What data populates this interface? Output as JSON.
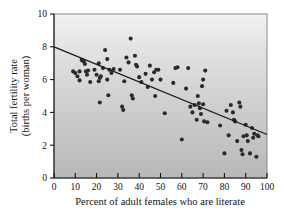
{
  "chart_data": {
    "type": "scatter",
    "title": "",
    "xlabel": "Percent of adult females who are literate",
    "ylabel": "Total fertility rate (births per woman)",
    "ylabel_line1": "Total fertility rate",
    "ylabel_line2": "(births per woman)",
    "xlim": [
      0,
      100
    ],
    "ylim": [
      0,
      10
    ],
    "xticks": [
      0,
      10,
      20,
      30,
      40,
      50,
      60,
      70,
      80,
      90,
      100
    ],
    "yticks": [
      0,
      2,
      4,
      6,
      8,
      10
    ],
    "xtick_labels": [
      "0",
      "10",
      "20",
      "30",
      "40",
      "50",
      "60",
      "70",
      "80",
      "90",
      "100"
    ],
    "ytick_labels": [
      "0",
      "2",
      "4",
      "6",
      "8",
      "10"
    ],
    "grid": false,
    "legend": "none",
    "background": "vertical gradient light-gray to medium-gray",
    "marker_color": "#2b2b2b",
    "trend_line_color": "#1a1a1a",
    "trend_line": {
      "label": "linear regression",
      "x_start": 0,
      "y_start": 8.0,
      "x_end": 100,
      "y_end": 2.65
    },
    "points": [
      [
        9,
        6.5
      ],
      [
        10,
        6.4
      ],
      [
        11,
        6.2
      ],
      [
        12,
        5.95
      ],
      [
        12,
        6.5
      ],
      [
        13,
        7.2
      ],
      [
        13.5,
        7.15
      ],
      [
        14,
        7.1
      ],
      [
        14.5,
        6.95
      ],
      [
        15,
        6.5
      ],
      [
        15.5,
        6.3
      ],
      [
        16,
        6.55
      ],
      [
        17,
        5.85
      ],
      [
        19,
        6.6
      ],
      [
        20,
        6.3
      ],
      [
        21,
        7.0
      ],
      [
        21,
        5.9
      ],
      [
        21.5,
        6.1
      ],
      [
        21.5,
        4.6
      ],
      [
        22,
        6.2
      ],
      [
        23,
        6.7
      ],
      [
        24,
        7.8
      ],
      [
        25,
        7.25
      ],
      [
        25,
        6.0
      ],
      [
        25.5,
        5.05
      ],
      [
        26,
        6.6
      ],
      [
        27,
        6.4
      ],
      [
        28,
        6.65
      ],
      [
        31,
        6.6
      ],
      [
        32,
        4.35
      ],
      [
        32.5,
        4.15
      ],
      [
        33,
        5.9
      ],
      [
        34,
        7.35
      ],
      [
        35,
        7.05
      ],
      [
        36,
        8.5
      ],
      [
        36.5,
        5.05
      ],
      [
        37,
        4.85
      ],
      [
        38,
        7.45
      ],
      [
        38.5,
        6.9
      ],
      [
        39,
        6.8
      ],
      [
        40,
        6.15
      ],
      [
        41,
        5.85
      ],
      [
        43,
        6.35
      ],
      [
        44,
        5.55
      ],
      [
        45,
        6.85
      ],
      [
        46,
        6.0
      ],
      [
        47,
        6.45
      ],
      [
        47.5,
        5.0
      ],
      [
        48,
        6.6
      ],
      [
        49,
        6.6
      ],
      [
        50,
        6.0
      ],
      [
        52,
        3.95
      ],
      [
        56,
        5.8
      ],
      [
        57,
        6.7
      ],
      [
        58,
        6.75
      ],
      [
        60,
        2.35
      ],
      [
        62,
        5.45
      ],
      [
        63,
        6.7
      ],
      [
        64,
        4.35
      ],
      [
        65,
        4.0
      ],
      [
        66,
        4.45
      ],
      [
        67,
        3.55
      ],
      [
        67.5,
        5.0
      ],
      [
        68,
        4.55
      ],
      [
        68.5,
        4.25
      ],
      [
        69,
        3.9
      ],
      [
        69.5,
        5.6
      ],
      [
        70,
        6.0
      ],
      [
        70,
        4.5
      ],
      [
        70.5,
        3.45
      ],
      [
        71,
        6.55
      ],
      [
        72,
        3.4
      ],
      [
        78,
        3.2
      ],
      [
        80,
        1.5
      ],
      [
        81,
        4.1
      ],
      [
        82,
        2.6
      ],
      [
        83,
        4.45
      ],
      [
        84,
        4.0
      ],
      [
        84.5,
        3.55
      ],
      [
        85,
        3.45
      ],
      [
        86,
        2.25
      ],
      [
        87,
        4.6
      ],
      [
        87.5,
        4.35
      ],
      [
        88,
        1.7
      ],
      [
        88.5,
        1.45
      ],
      [
        89,
        2.55
      ],
      [
        90,
        3.25
      ],
      [
        90.5,
        2.6
      ],
      [
        91,
        2.25
      ],
      [
        92,
        1.5
      ],
      [
        93,
        3.05
      ],
      [
        93.5,
        2.45
      ],
      [
        94,
        2.7
      ],
      [
        95,
        1.3
      ],
      [
        95.5,
        2.6
      ],
      [
        96,
        2.55
      ]
    ]
  }
}
